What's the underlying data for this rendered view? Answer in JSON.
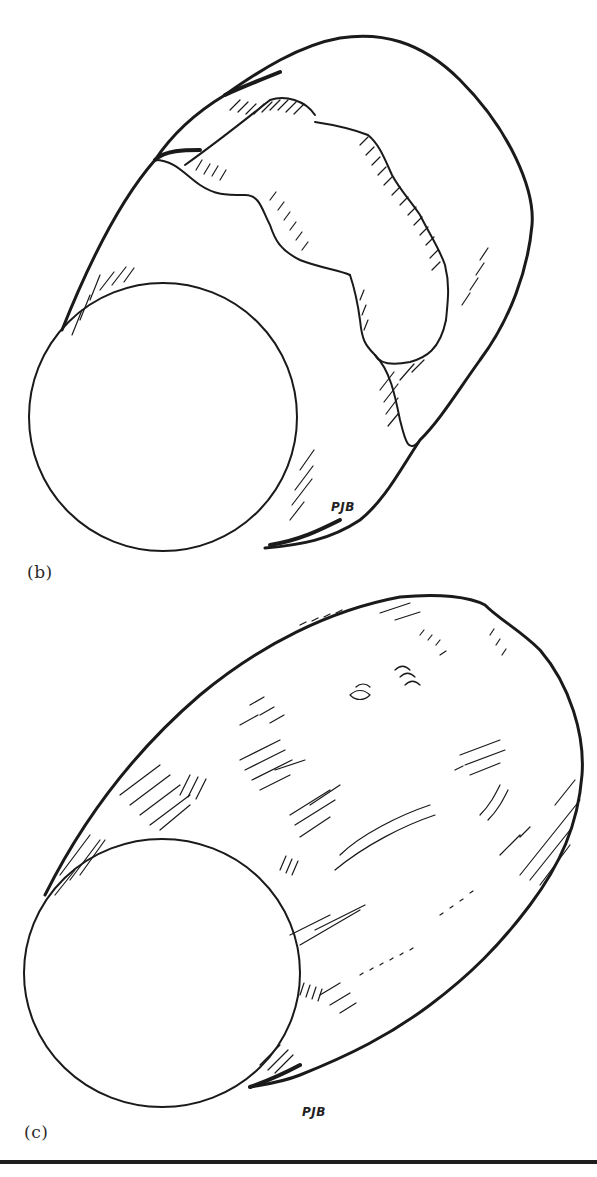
{
  "figure": {
    "panels": [
      {
        "id": "b",
        "label": "(b)",
        "signature": "PJB",
        "subject": "pen-and-ink drawing of a cylindrical object with circular end face and wavy hatched band"
      },
      {
        "id": "c",
        "label": "(c)",
        "signature": "PJB",
        "subject": "pen-and-ink drawing of a textured, barrel-shaped cylindrical object with circular end face"
      }
    ],
    "colors": {
      "ink": "#1a1a1a",
      "paper": "#ffffff",
      "rule": "#1e1e1e"
    }
  }
}
